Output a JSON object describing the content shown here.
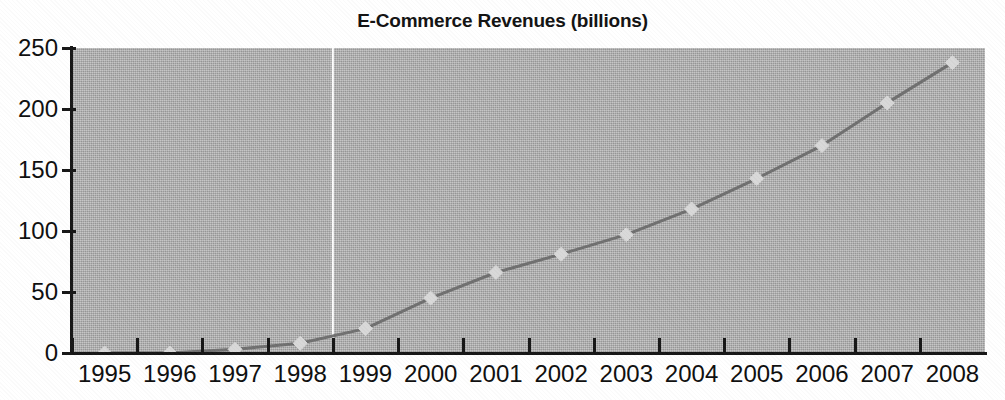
{
  "chart_data": {
    "type": "line",
    "title": "E-Commerce Revenues (billions)",
    "xlabel": "",
    "ylabel": "",
    "categories": [
      "1995",
      "1996",
      "1997",
      "1998",
      "1999",
      "2000",
      "2001",
      "2002",
      "2003",
      "2004",
      "2005",
      "2006",
      "2007",
      "2008"
    ],
    "values": [
      0,
      0,
      3,
      8,
      20,
      45,
      66,
      81,
      97,
      118,
      143,
      170,
      205,
      238
    ],
    "series": [
      {
        "name": "E-Commerce Revenues",
        "values": [
          0,
          0,
          3,
          8,
          20,
          45,
          66,
          81,
          97,
          118,
          143,
          170,
          205,
          238
        ]
      }
    ],
    "ylim": [
      0,
      250
    ],
    "y_ticks": [
      0,
      50,
      100,
      150,
      200,
      250
    ],
    "y_tick_labels": [
      "0",
      "50",
      "100",
      "150",
      "200",
      "250"
    ],
    "grid": false,
    "legend": "none",
    "marker": "diamond",
    "annotations": [
      {
        "name": "actual-projected-divider",
        "type": "vertical-line",
        "at_category_boundary": "1998/1999",
        "color": "#ffffff"
      }
    ],
    "colors": {
      "plot_background": "#b4b4b4",
      "line": "#6f6f6f",
      "marker": "#d8d8d8",
      "axis": "#151515",
      "text": "#0d0d0d",
      "page_background": "#ffffff",
      "divider": "#ffffff"
    }
  }
}
